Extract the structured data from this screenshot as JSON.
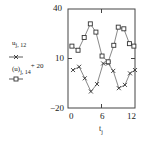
{
  "chart_data": {
    "type": "line",
    "title": "",
    "xlabel": "t_j",
    "ylabel": "",
    "xlim": [
      0,
      12
    ],
    "ylim": [
      -20,
      40
    ],
    "x_ticks": [
      "0",
      "6",
      "12"
    ],
    "y_ticks": [
      "40",
      "10",
      "-20"
    ],
    "grid": false,
    "legend_position": "left",
    "series": [
      {
        "name": "u_{j,12}",
        "marker": "x",
        "color": "#333333",
        "x": [
          0.9,
          2.0,
          3.0,
          4.1,
          5.2,
          6.3,
          7.2,
          8.1,
          9.1,
          10.2,
          11.1,
          12.0
        ],
        "y": [
          3,
          5,
          -2,
          -10,
          -5.5,
          7,
          7,
          2.5,
          -8,
          -6,
          1,
          3
        ]
      },
      {
        "name": "(u)_{j,14} + 20",
        "marker": "square",
        "color": "#333333",
        "x": [
          0.7,
          1.8,
          2.9,
          4.0,
          5.0,
          6.1,
          7.2,
          8.2,
          9.0,
          10.0,
          11.0,
          11.8
        ],
        "y": [
          17.5,
          15,
          22.7,
          31,
          26,
          11.5,
          8,
          18,
          29,
          28,
          19,
          17.5
        ]
      }
    ]
  },
  "labels": {
    "y_top": "40",
    "y_mid": "10",
    "y_bot": "−20",
    "x_left": "0",
    "x_mid": "6",
    "x_right": "12",
    "legend1_var": "u",
    "legend1_sub": "j, 12",
    "legend2_var": "(u)",
    "legend2_sub": "j, 14",
    "legend2_sup": "+ 20",
    "xaxis_var": "t",
    "xaxis_sub": "j"
  }
}
